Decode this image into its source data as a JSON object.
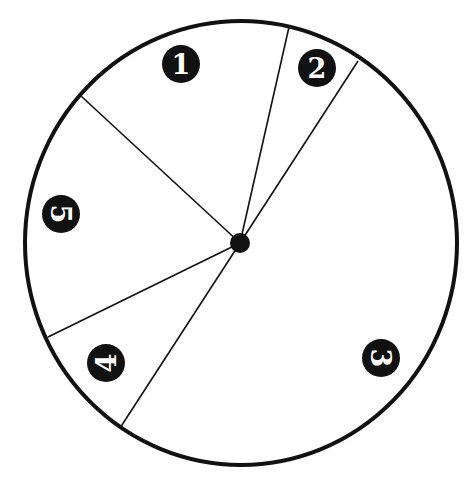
{
  "diagram": {
    "type": "spinner-wheel",
    "colors": {
      "stroke": "#111111",
      "fill": "#ffffff",
      "badge": "#111111",
      "badge_text": "#ffffff"
    },
    "circle": {
      "cx": 241,
      "cy": 243,
      "rx": 216,
      "ry": 222
    },
    "hub": {
      "cx": 240,
      "cy": 243,
      "r": 10
    },
    "spokes": [
      {
        "x2": 289,
        "y2": 27
      },
      {
        "x2": 358,
        "y2": 61
      },
      {
        "x2": 81,
        "y2": 96
      },
      {
        "x2": 48,
        "y2": 337
      },
      {
        "x2": 120,
        "y2": 428
      }
    ],
    "sections": [
      {
        "label": "1",
        "x": 181,
        "y": 64,
        "rotate": 0
      },
      {
        "label": "2",
        "x": 317,
        "y": 68,
        "rotate": 0
      },
      {
        "label": "3",
        "x": 381,
        "y": 358,
        "rotate": 90
      },
      {
        "label": "4",
        "x": 106,
        "y": 363,
        "rotate": -90
      },
      {
        "label": "5",
        "x": 61,
        "y": 214,
        "rotate": 90
      }
    ]
  }
}
